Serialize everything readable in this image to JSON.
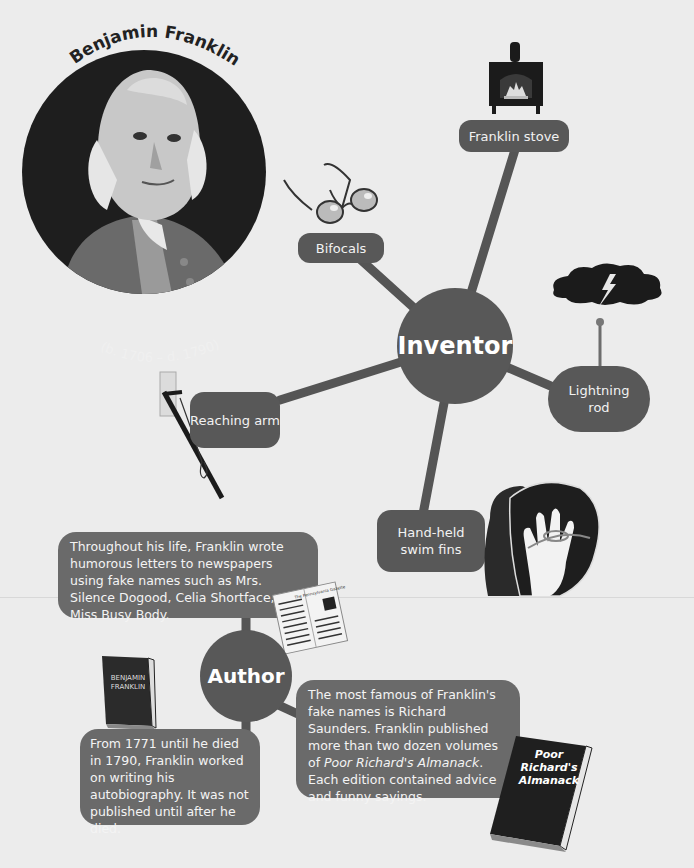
{
  "portrait": {
    "name": "Benjamin Franklin",
    "dates": "(b. 1706 – d. 1790)"
  },
  "inventor": {
    "hub_label": "Inventor",
    "items": [
      {
        "label": "Franklin stove",
        "icon": "stove-icon"
      },
      {
        "label": "Bifocals",
        "icon": "eyeglasses-icon"
      },
      {
        "label": "Lightning rod",
        "icon": "storm-cloud-lightning-icon"
      },
      {
        "label": "Reaching arm",
        "icon": "reaching-arm-tool-icon"
      },
      {
        "label": "Hand-held swim fins",
        "icon": "swim-fin-hand-icon"
      }
    ]
  },
  "author": {
    "hub_label": "Author",
    "boxes": [
      {
        "text": "Throughout his life, Franklin wrote humorous letters to newspapers using fake names such as Mrs. Silence Dogood, Celia Shortface, and Miss Busy Body.",
        "icon": "newspaper-icon",
        "icon_text": "The Pennsylvania Gazette"
      },
      {
        "text": "From 1771 until he died in 1790, Franklin worked on writing his autobiography. It was not published until after he died.",
        "icon": "book-icon",
        "icon_text": "BENJAMIN FRANKLIN"
      },
      {
        "text_before": "The most famous of Franklin's fake names is Richard Saunders. Franklin published more than two dozen volumes of ",
        "text_italic": "Poor Richard's Almanack",
        "text_after": ". Each edition contained advice and funny sayings.",
        "icon": "almanack-book-icon",
        "icon_text": "Poor Richard's Almanack"
      }
    ]
  },
  "colors": {
    "background": "#ececec",
    "node": "#585858",
    "textbox": "#6a6a6a",
    "portrait_circle": "#1e1e1e"
  }
}
